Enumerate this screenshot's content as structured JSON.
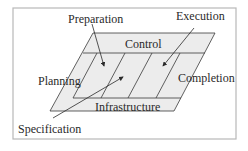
{
  "diagram": {
    "labels": {
      "preparation": "Preparation",
      "execution": "Execution",
      "control": "Control",
      "planning": "Planning",
      "completion": "Completion",
      "infrastructure": "Infrastructure",
      "specification": "Specification"
    },
    "colors": {
      "frame": "#b8b8b8",
      "fill": "#ececec",
      "stroke": "#3a3a3a",
      "text": "#2a2a2a"
    }
  }
}
